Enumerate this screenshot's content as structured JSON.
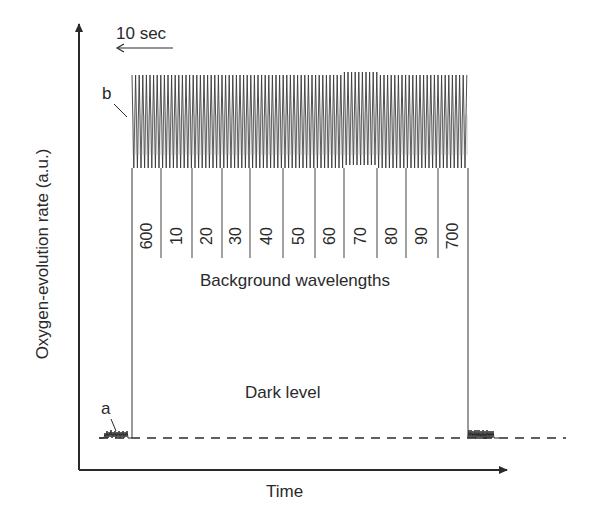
{
  "chart_data": {
    "type": "line",
    "title": "",
    "xlabel": "Time",
    "ylabel": "Oxygen-evolution rate (a.u.)",
    "scale_bar": {
      "label": "10 sec",
      "direction": "left"
    },
    "trace_labels": {
      "a": "a",
      "b": "b"
    },
    "dark_level_label": "Dark level",
    "background_label": "Background wavelengths",
    "background_wavelengths": [
      "600",
      "10",
      "20",
      "30",
      "40",
      "50",
      "60",
      "70",
      "80",
      "90",
      "700"
    ],
    "segments": [
      {
        "name": "a",
        "description": "baseline oscillation before flashes",
        "level": "dark"
      },
      {
        "name": "b",
        "description": "high-amplitude oscillation during background illumination",
        "level": "high"
      },
      {
        "name": "post",
        "description": "baseline oscillation after flashes",
        "level": "dark"
      }
    ],
    "grid": false,
    "legend": "none"
  },
  "labels": {
    "ylabel": "Oxygen-evolution rate (a.u.)",
    "xlabel": "Time",
    "scale": "10 sec",
    "a": "a",
    "b": "b",
    "dark_level": "Dark level",
    "background": "Background wavelengths",
    "wavelengths": [
      "600",
      "10",
      "20",
      "30",
      "40",
      "50",
      "60",
      "70",
      "80",
      "90",
      "700"
    ]
  }
}
